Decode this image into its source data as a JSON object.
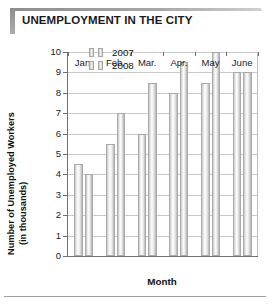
{
  "header": {
    "title": "UNEMPLOYMENT IN THE CITY"
  },
  "colors": {
    "series_2007": "#e8e8e8",
    "series_2008": "#e0e0e0",
    "axis": "#6f6f6f",
    "grid": "#c9c9c9",
    "banner": "#9a9a9a",
    "text": "#1a1a1a"
  },
  "legend": {
    "position": "top-left-inside",
    "entries": [
      {
        "label": "2007"
      },
      {
        "label": "2008"
      }
    ]
  },
  "axes": {
    "y": {
      "label_line1": "Number of Unemployed Workers",
      "label_line2": "(in thousands)",
      "ticks": [
        "10",
        "9",
        "8",
        "7",
        "6",
        "5",
        "4",
        "3",
        "2",
        "1",
        "0"
      ],
      "min": 0,
      "max": 10,
      "step": 1
    },
    "x": {
      "label": "Month",
      "ticks": [
        "Jan.",
        "Feb.",
        "Mar.",
        "Apr.",
        "May",
        "June"
      ]
    }
  },
  "chart_data": {
    "type": "bar",
    "title": "UNEMPLOYMENT IN THE CITY",
    "subtitle": "",
    "xlabel": "Month",
    "ylabel": "Number of Unemployed Workers (in thousands)",
    "categories": [
      "Jan.",
      "Feb.",
      "Mar.",
      "Apr.",
      "May",
      "June"
    ],
    "series": [
      {
        "name": "2007",
        "values": [
          4.5,
          5.5,
          6.0,
          8.0,
          8.5,
          9.0
        ]
      },
      {
        "name": "2008",
        "values": [
          4.0,
          7.0,
          8.5,
          9.5,
          10.0,
          9.0
        ]
      }
    ],
    "ylim": [
      0,
      10
    ],
    "ytick_step": 1,
    "grid": true,
    "grid_axis": "y",
    "legend": true,
    "legend_position": "upper left inside plot",
    "units": "thousands of workers"
  }
}
